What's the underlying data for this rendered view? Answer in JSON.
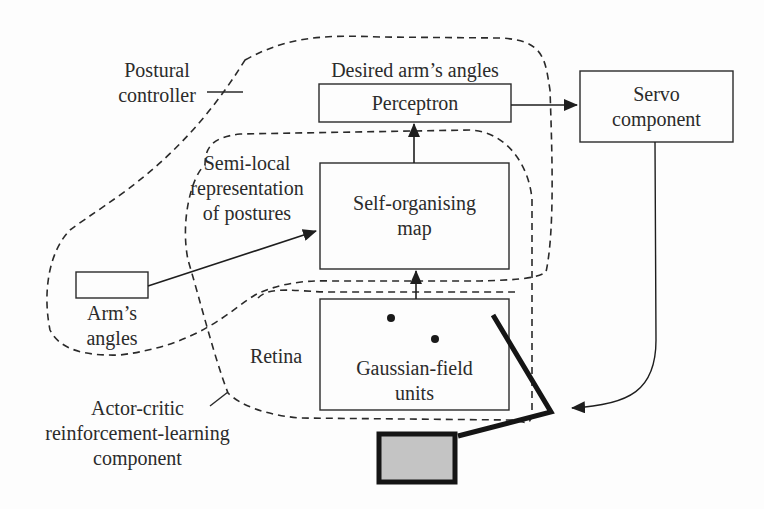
{
  "diagram": {
    "labels": {
      "postural_controller": [
        "Postural",
        "controller"
      ],
      "desired_arm_angles": "Desired arm’s angles",
      "semi_local": [
        "Semi-local",
        "representation",
        "of postures"
      ],
      "arms_angles": [
        "Arm’s",
        "angles"
      ],
      "retina": "Retina",
      "actor_critic": [
        "Actor-critic",
        "reinforcement-learning",
        "component"
      ]
    },
    "boxes": {
      "perceptron": "Perceptron",
      "servo": [
        "Servo",
        "component"
      ],
      "som": [
        "Self-organising",
        "map"
      ],
      "gaussian": [
        "Gaussian-field",
        "units"
      ]
    },
    "colors": {
      "stroke": "#2a2a2a",
      "arm_fill": "#c4c4c4",
      "background": "#fdfdfd"
    },
    "edges": [
      {
        "from": "Arm's angles",
        "to": "Self-organising map"
      },
      {
        "from": "Gaussian-field units",
        "to": "Self-organising map"
      },
      {
        "from": "Self-organising map",
        "to": "Perceptron"
      },
      {
        "from": "Perceptron",
        "to": "Servo component"
      },
      {
        "from": "Servo component",
        "to": "Arm"
      }
    ]
  }
}
